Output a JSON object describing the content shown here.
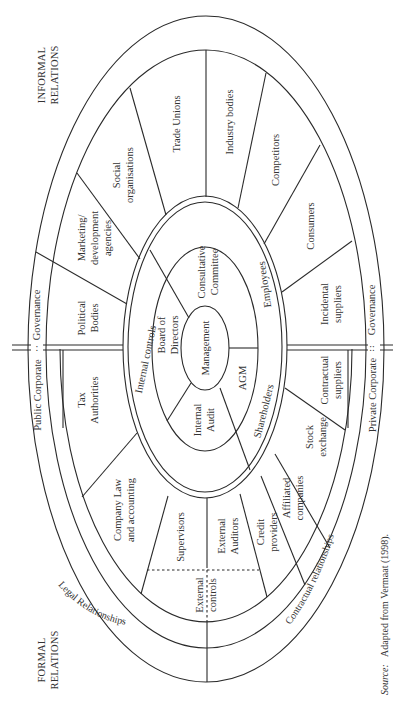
{
  "figure": {
    "corner_labels": {
      "informal": [
        "INFORMAL",
        "RELATIONS"
      ],
      "formal": [
        "FORMAL",
        "RELATIONS"
      ]
    },
    "outer_band": {
      "public_corporate": "Public Corporate",
      "public_governance": "Governance",
      "private_corporate": "Private Corporate",
      "private_governance": "Governance"
    },
    "relationship_band": {
      "legal": "Legal Relationships",
      "contractual": "Contractual relationships"
    },
    "informal_segments": {
      "political_bodies": [
        "Political",
        "Bodies"
      ],
      "marketing": [
        "Marketing/",
        "development",
        "agencies"
      ],
      "social": [
        "Social",
        "organisations"
      ],
      "trade_unions": "Trade Unions",
      "industry_bodies": "Industry bodies",
      "competitors": "Competitors",
      "consumers": "Consumers",
      "incidental_suppliers": [
        "Incidental",
        "suppliers"
      ]
    },
    "formal_segments": {
      "tax_authorities": [
        "Tax",
        "Authorities"
      ],
      "company_law": [
        "Company Law",
        "and accounting"
      ],
      "supervisors": "Supervisors",
      "external_auditors": [
        "External",
        "Auditors"
      ],
      "external_controls": [
        "External",
        "controls"
      ],
      "credit_providers": [
        "Credit",
        "providers"
      ],
      "affiliated_companies": [
        "Affiliated",
        "companies"
      ],
      "stock_exchange": [
        "Stock",
        "exchange"
      ],
      "contractual_suppliers": [
        "Contractual",
        "suppliers"
      ]
    },
    "inner_ring": {
      "internal_controls": "Internal controls",
      "employees": "Employees",
      "shareholders": "Shareholders"
    },
    "core_ring": {
      "board": [
        "Board of",
        "Directors"
      ],
      "consultative": [
        "Consultative",
        "Committee"
      ],
      "internal_audit": [
        "Internal",
        "Audit"
      ],
      "agm": "AGM"
    },
    "center": "Management",
    "source_label": "Source:",
    "source_text": "Adapted from Vermaat (1998)."
  },
  "colors": {
    "line": "#2a2a2a",
    "text": "#333333",
    "background": "#ffffff"
  }
}
